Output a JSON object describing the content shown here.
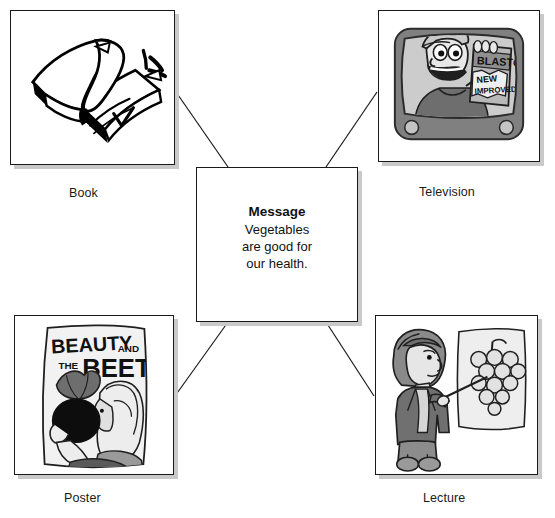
{
  "diagram": {
    "type": "concept-map",
    "center": {
      "title": "Message",
      "body_lines": [
        "Vegetables",
        "are good for",
        "our health."
      ],
      "body_text": "Vegetables are good for our health."
    },
    "nodes": [
      {
        "id": "book",
        "label": "Book",
        "position": "top-left",
        "illustration": "open-book-with-motion-lines"
      },
      {
        "id": "television",
        "label": "Television",
        "position": "top-right",
        "illustration": "cartoon-pitchman-on-tv-holding-product-box",
        "artwork_text": [
          "BLASTO",
          "NEW",
          "IMPROVED"
        ]
      },
      {
        "id": "poster",
        "label": "Poster",
        "position": "bottom-left",
        "illustration": "movie-poster-woman-holding-beet",
        "artwork_text": [
          "BEAUTY",
          "AND",
          "THE",
          "BEET"
        ]
      },
      {
        "id": "lecture",
        "label": "Lecture",
        "position": "bottom-right",
        "illustration": "woman-with-pointer-at-chart-of-grapes"
      }
    ],
    "connections": [
      {
        "from": "book",
        "to": "center"
      },
      {
        "from": "television",
        "to": "center"
      },
      {
        "from": "poster",
        "to": "center"
      },
      {
        "from": "lecture",
        "to": "center"
      }
    ],
    "colors": {
      "line": "#1a1a1a",
      "shadow": "#c9c9c9",
      "background": "#ffffff",
      "art_dark": "#4a4a4a",
      "art_mid": "#8c8c8c",
      "art_light": "#cfcfcf"
    }
  }
}
